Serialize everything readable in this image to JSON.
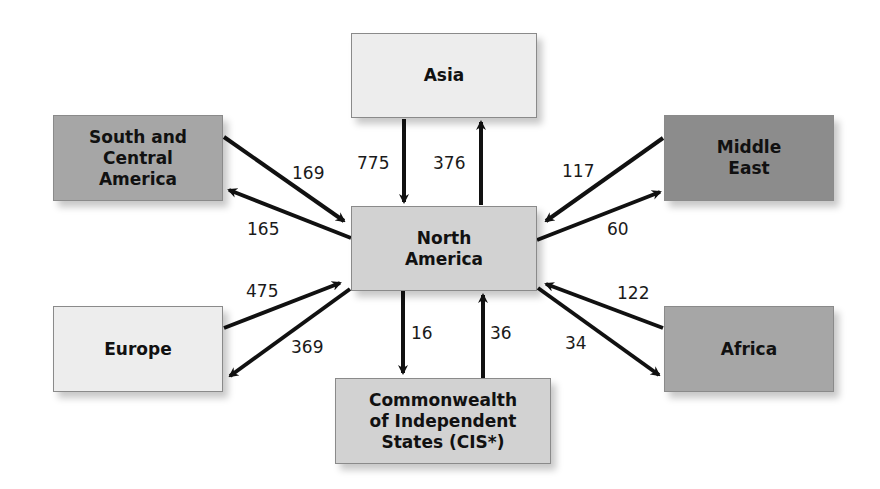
{
  "diagram": {
    "type": "flow",
    "center": {
      "id": "north-america",
      "label": "North America"
    },
    "regions": {
      "asia": "Asia",
      "south_central_america": "South and Central America",
      "middle_east": "Middle East",
      "europe": "Europe",
      "africa": "Africa",
      "cis": "Commonwealth of Independent States (CIS*)"
    },
    "flows": [
      {
        "from": "Asia",
        "to": "North America",
        "value": "775"
      },
      {
        "from": "North America",
        "to": "Asia",
        "value": "376"
      },
      {
        "from": "South and Central America",
        "to": "North America",
        "value": "169"
      },
      {
        "from": "North America",
        "to": "South and Central America",
        "value": "165"
      },
      {
        "from": "Middle East",
        "to": "North America",
        "value": "117"
      },
      {
        "from": "North America",
        "to": "Middle East",
        "value": "60"
      },
      {
        "from": "Europe",
        "to": "North America",
        "value": "475"
      },
      {
        "from": "North America",
        "to": "Europe",
        "value": "369"
      },
      {
        "from": "Africa",
        "to": "North America",
        "value": "122"
      },
      {
        "from": "North America",
        "to": "Africa",
        "value": "34"
      },
      {
        "from": "North America",
        "to": "Commonwealth of Independent States (CIS*)",
        "value": "16"
      },
      {
        "from": "Commonwealth of Independent States (CIS*)",
        "to": "North America",
        "value": "36"
      }
    ]
  },
  "labels": {
    "asia_to_na": "775",
    "na_to_asia": "376",
    "sca_to_na": "169",
    "na_to_sca": "165",
    "me_to_na": "117",
    "na_to_me": "60",
    "eu_to_na": "475",
    "na_to_eu": "369",
    "af_to_na": "122",
    "na_to_af": "34",
    "na_to_cis": "16",
    "cis_to_na": "36"
  },
  "box_lines": {
    "asia": [
      "Asia"
    ],
    "sca": [
      "South and",
      "Central",
      "America"
    ],
    "me": [
      "Middle",
      "East"
    ],
    "na": [
      "North",
      "America"
    ],
    "eu": [
      "Europe"
    ],
    "af": [
      "Africa"
    ],
    "cis": [
      "Commonwealth",
      "of Independent",
      "States (CIS*)"
    ]
  },
  "colors": {
    "light": "#ededed",
    "medium": "#d2d2d2",
    "dark": "#a6a6a6",
    "darker": "#8c8c8c",
    "arrow": "#111111"
  }
}
